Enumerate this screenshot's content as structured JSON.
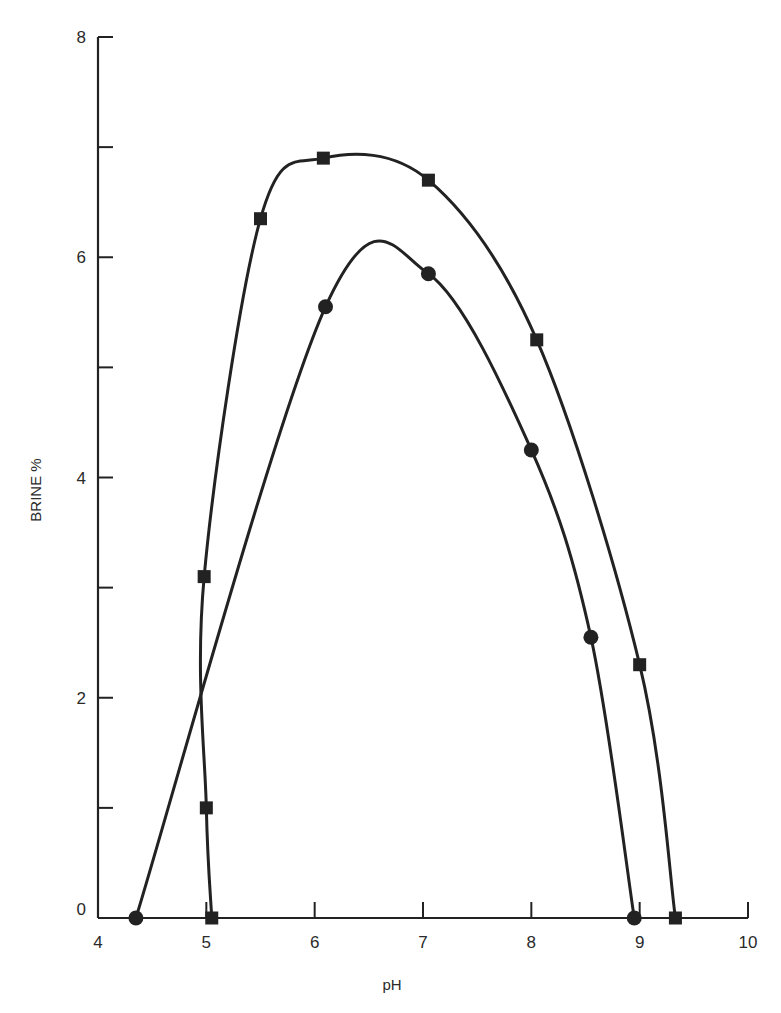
{
  "chart_data": {
    "type": "line",
    "title": "",
    "xlabel": "pH",
    "ylabel": "BRINE %",
    "xlim": [
      4,
      10
    ],
    "ylim": [
      0,
      8
    ],
    "xticks": [
      4,
      5,
      6,
      7,
      8,
      9,
      10
    ],
    "yticks_major": [
      0,
      2,
      4,
      6,
      8
    ],
    "yticks_minor": [
      1,
      3,
      5,
      7
    ],
    "grid": false,
    "legend": null,
    "series": [
      {
        "name": "square-marker series",
        "marker": "square",
        "x": [
          5.05,
          5.0,
          4.98,
          5.5,
          6.08,
          7.05,
          8.05,
          9.0,
          9.33
        ],
        "y": [
          0,
          1.0,
          3.1,
          6.35,
          6.9,
          6.7,
          5.25,
          2.3,
          0
        ]
      },
      {
        "name": "circle-marker series",
        "marker": "circle",
        "x": [
          4.35,
          6.1,
          7.05,
          8.0,
          8.55,
          8.95
        ],
        "y": [
          0,
          5.55,
          5.85,
          4.25,
          2.55,
          0
        ]
      }
    ]
  },
  "axes": {
    "x_title": "pH",
    "y_title": "BRINE %",
    "x_tick_labels": [
      "4",
      "5",
      "6",
      "7",
      "8",
      "9",
      "10"
    ],
    "y_tick_labels": [
      "0",
      "2",
      "4",
      "6",
      "8"
    ]
  },
  "colors": {
    "ink": "#222222",
    "background": "#ffffff"
  }
}
